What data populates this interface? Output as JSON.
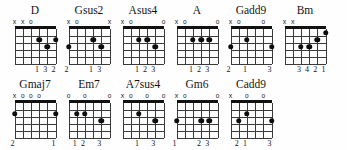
{
  "sheet": {
    "title": "Guitar Chord Diagrams",
    "strings": 6,
    "frets": 5,
    "marker_open": "o",
    "marker_muted": "x",
    "ink_color": "#111111",
    "paper_color": "#fefefe"
  },
  "chart_data": {
    "type": "table",
    "xlabel": "Strings (6 low E to 1 high E)",
    "ylabel": "Frets",
    "rows": [
      {
        "row_index": 1,
        "chords": [
          {
            "name": "D",
            "open_markers": [
              {
                "string": 6,
                "symbol": "x"
              },
              {
                "string": 5,
                "symbol": "x"
              },
              {
                "string": 4,
                "symbol": "o"
              }
            ],
            "dots": [
              {
                "string": 3,
                "fret": 2
              },
              {
                "string": 2,
                "fret": 3
              },
              {
                "string": 1,
                "fret": 2
              }
            ],
            "fingering": [
              {
                "string": 3,
                "digit": "1"
              },
              {
                "string": 2,
                "digit": "3"
              },
              {
                "string": 1,
                "digit": "2"
              }
            ]
          },
          {
            "name": "Gsus2",
            "open_markers": [
              {
                "string": 6,
                "symbol": "x"
              },
              {
                "string": 5,
                "symbol": "o"
              },
              {
                "string": 1,
                "symbol": "x"
              }
            ],
            "dots": [
              {
                "string": 6,
                "fret": 3
              },
              {
                "string": 3,
                "fret": 2
              },
              {
                "string": 2,
                "fret": 3
              }
            ],
            "fingering": [
              {
                "string": 6,
                "digit": "2"
              },
              {
                "string": 3,
                "digit": "1"
              },
              {
                "string": 2,
                "digit": "3"
              }
            ]
          },
          {
            "name": "Asus4",
            "open_markers": [
              {
                "string": 6,
                "symbol": "x"
              },
              {
                "string": 5,
                "symbol": "o"
              },
              {
                "string": 1,
                "symbol": "o"
              }
            ],
            "dots": [
              {
                "string": 4,
                "fret": 2
              },
              {
                "string": 3,
                "fret": 2
              },
              {
                "string": 2,
                "fret": 3
              }
            ],
            "fingering": [
              {
                "string": 4,
                "digit": "1"
              },
              {
                "string": 3,
                "digit": "2"
              },
              {
                "string": 2,
                "digit": "3"
              }
            ]
          },
          {
            "name": "A",
            "open_markers": [
              {
                "string": 6,
                "symbol": "x"
              },
              {
                "string": 5,
                "symbol": "o"
              },
              {
                "string": 1,
                "symbol": "o"
              }
            ],
            "dots": [
              {
                "string": 4,
                "fret": 2
              },
              {
                "string": 3,
                "fret": 2
              },
              {
                "string": 2,
                "fret": 2
              }
            ],
            "fingering": [
              {
                "string": 4,
                "digit": "1"
              },
              {
                "string": 3,
                "digit": "2"
              },
              {
                "string": 2,
                "digit": "3"
              }
            ]
          },
          {
            "name": "Gadd9",
            "open_markers": [
              {
                "string": 6,
                "symbol": "x"
              },
              {
                "string": 5,
                "symbol": "o"
              },
              {
                "string": 2,
                "symbol": "o"
              }
            ],
            "dots": [
              {
                "string": 6,
                "fret": 3
              },
              {
                "string": 4,
                "fret": 2
              },
              {
                "string": 1,
                "fret": 3
              }
            ],
            "fingering": [
              {
                "string": 6,
                "digit": "2"
              },
              {
                "string": 4,
                "digit": "1"
              },
              {
                "string": 1,
                "digit": "3"
              }
            ]
          },
          {
            "name": "Bm",
            "open_markers": [
              {
                "string": 6,
                "symbol": "x"
              },
              {
                "string": 5,
                "symbol": "x"
              }
            ],
            "dots": [
              {
                "string": 4,
                "fret": 3
              },
              {
                "string": 3,
                "fret": 3
              },
              {
                "string": 2,
                "fret": 2
              },
              {
                "string": 1,
                "fret": 1
              }
            ],
            "fingering": [
              {
                "string": 4,
                "digit": "3"
              },
              {
                "string": 3,
                "digit": "4"
              },
              {
                "string": 2,
                "digit": "2"
              },
              {
                "string": 1,
                "digit": "1"
              }
            ]
          }
        ]
      },
      {
        "row_index": 2,
        "chords": [
          {
            "name": "Gmaj7",
            "open_markers": [
              {
                "string": 6,
                "symbol": "x"
              },
              {
                "string": 5,
                "symbol": "o"
              },
              {
                "string": 4,
                "symbol": "o"
              },
              {
                "string": 3,
                "symbol": "o"
              }
            ],
            "dots": [
              {
                "string": 6,
                "fret": 2
              },
              {
                "string": 1,
                "fret": 2
              }
            ],
            "fingering": [
              {
                "string": 6,
                "digit": "2"
              },
              {
                "string": 1,
                "digit": "1"
              }
            ]
          },
          {
            "name": "Em7",
            "open_markers": [
              {
                "string": 6,
                "symbol": "o"
              },
              {
                "string": 4,
                "symbol": "o"
              },
              {
                "string": 1,
                "symbol": "o"
              }
            ],
            "dots": [
              {
                "string": 5,
                "fret": 2
              },
              {
                "string": 4,
                "fret": 2
              },
              {
                "string": 2,
                "fret": 3
              }
            ],
            "fingering": [
              {
                "string": 5,
                "digit": "1"
              },
              {
                "string": 4,
                "digit": "2"
              },
              {
                "string": 2,
                "digit": "3"
              }
            ]
          },
          {
            "name": "A7sus4",
            "open_markers": [
              {
                "string": 6,
                "symbol": "x"
              },
              {
                "string": 5,
                "symbol": "o"
              },
              {
                "string": 3,
                "symbol": "o"
              },
              {
                "string": 1,
                "symbol": "o"
              }
            ],
            "dots": [
              {
                "string": 4,
                "fret": 2
              },
              {
                "string": 2,
                "fret": 3
              }
            ],
            "fingering": [
              {
                "string": 4,
                "digit": "1"
              },
              {
                "string": 2,
                "digit": "3"
              }
            ]
          },
          {
            "name": "Gm6",
            "open_markers": [
              {
                "string": 6,
                "symbol": "x"
              },
              {
                "string": 5,
                "symbol": "o"
              },
              {
                "string": 1,
                "symbol": "o"
              }
            ],
            "dots": [
              {
                "string": 6,
                "fret": 3
              },
              {
                "string": 3,
                "fret": 3
              },
              {
                "string": 2,
                "fret": 3
              }
            ],
            "fingering": [
              {
                "string": 6,
                "digit": "1"
              },
              {
                "string": 3,
                "digit": "2"
              },
              {
                "string": 2,
                "digit": "3"
              }
            ]
          },
          {
            "name": "Cadd9",
            "open_markers": [
              {
                "string": 6,
                "symbol": "x"
              },
              {
                "string": 4,
                "symbol": "o"
              },
              {
                "string": 2,
                "symbol": "o"
              }
            ],
            "dots": [
              {
                "string": 5,
                "fret": 3
              },
              {
                "string": 4,
                "fret": 2
              },
              {
                "string": 1,
                "fret": 3
              }
            ],
            "fingering": [
              {
                "string": 5,
                "digit": "2"
              },
              {
                "string": 4,
                "digit": "1"
              },
              {
                "string": 1,
                "digit": "3"
              }
            ]
          }
        ]
      }
    ]
  }
}
